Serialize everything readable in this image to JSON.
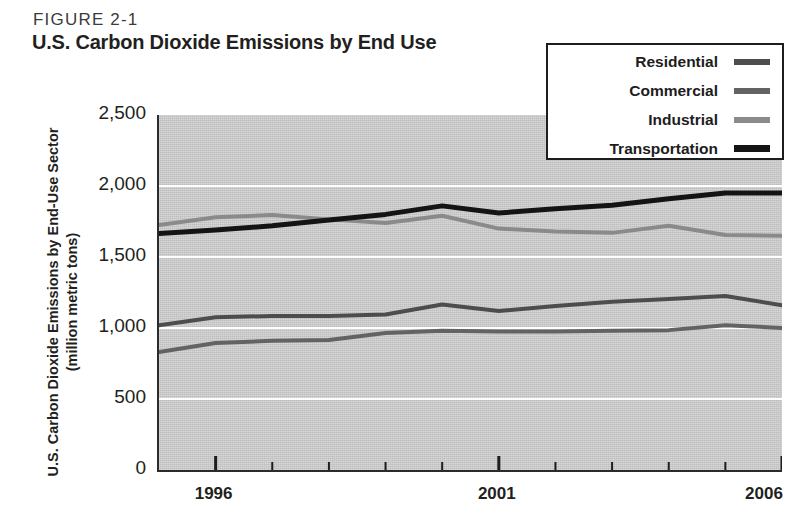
{
  "figure": {
    "label": "FIGURE 2-1",
    "title": "U.S. Carbon Dioxide Emissions by End Use"
  },
  "axes": {
    "y_title_line1": "U.S. Carbon Dioxide Emissions by End-Use Sector",
    "y_title_line2": "(million metric tons)",
    "y_ticks": [
      "2,500",
      "2,000",
      "1,500",
      "1,000",
      "500",
      "0"
    ],
    "x_ticks": [
      "1996",
      "2001",
      "2006"
    ]
  },
  "legend": {
    "items": [
      {
        "label": "Residential",
        "color": "#4d4d4d"
      },
      {
        "label": "Commercial",
        "color": "#636363"
      },
      {
        "label": "Industrial",
        "color": "#8a8a8a"
      },
      {
        "label": "Transportation",
        "color": "#141414"
      }
    ]
  },
  "colors": {
    "plot_background": "#c9c9c9",
    "gridline": "#ffffff",
    "axis": "#2b2b2b",
    "text": "#231f20"
  },
  "chart_data": {
    "type": "line",
    "title": "U.S. Carbon Dioxide Emissions by End Use",
    "xlabel": "",
    "ylabel": "U.S. Carbon Dioxide Emissions by End-Use Sector (million metric tons)",
    "ylim": [
      0,
      2500
    ],
    "xlim": [
      1995,
      2006
    ],
    "yticks": [
      0,
      500,
      1000,
      1500,
      2000,
      2500
    ],
    "xticks": [
      1996,
      2001,
      2006
    ],
    "xtick_labels": [
      "1996",
      "2001",
      "2006"
    ],
    "grid": true,
    "grid_axis": "y",
    "legend_position": "top-right",
    "x": [
      1995,
      1996,
      1997,
      1998,
      1999,
      2000,
      2001,
      2002,
      2003,
      2004,
      2005,
      2006
    ],
    "series": [
      {
        "name": "Residential",
        "color": "#4d4d4d",
        "values": [
          1020,
          1075,
          1085,
          1085,
          1095,
          1165,
          1120,
          1155,
          1185,
          1205,
          1225,
          1160
        ]
      },
      {
        "name": "Commercial",
        "color": "#636363",
        "values": [
          830,
          895,
          910,
          915,
          965,
          980,
          975,
          975,
          980,
          985,
          1020,
          1000
        ]
      },
      {
        "name": "Industrial",
        "color": "#8a8a8a",
        "values": [
          1725,
          1780,
          1795,
          1765,
          1740,
          1790,
          1700,
          1680,
          1670,
          1720,
          1655,
          1650
        ]
      },
      {
        "name": "Transportation",
        "color": "#141414",
        "values": [
          1665,
          1690,
          1720,
          1760,
          1800,
          1860,
          1810,
          1840,
          1865,
          1910,
          1950,
          1950
        ]
      }
    ]
  }
}
